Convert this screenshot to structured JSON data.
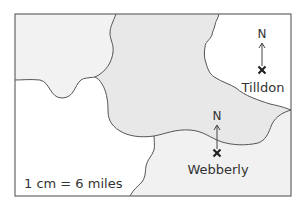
{
  "map": {
    "scale": "1 cm = 6 miles",
    "north_symbol": "N",
    "towns": [
      {
        "name": "Tilldon",
        "marker": "cross-marker",
        "north_arrow": true
      },
      {
        "name": "Webberly",
        "marker": "cross-marker",
        "north_arrow": true
      }
    ],
    "colors": {
      "region_top_left": "#f2f2f2",
      "region_center": "#e8e8e8",
      "region_bottom_left": "#ffffff",
      "region_top_right": "#ffffff",
      "region_bottom_right": "#f1f1f1",
      "boundary": "#555555"
    }
  }
}
